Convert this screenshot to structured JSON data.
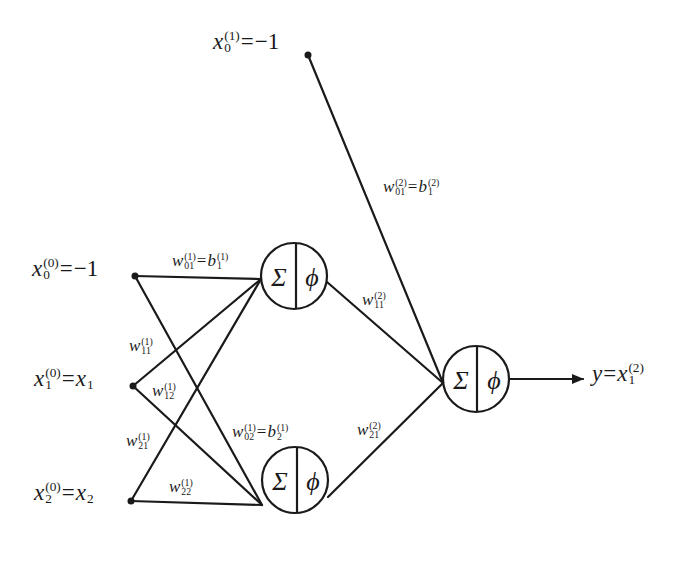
{
  "diagram": {
    "type": "neural-network",
    "colors": {
      "stroke": "#1a1a1a",
      "background": "#ffffff"
    },
    "layers": {
      "input": [
        {
          "id": "x0",
          "var": "x",
          "sub": "0",
          "sup": "(0)",
          "eq": "=",
          "rhs": "−1",
          "rhs_var": "",
          "rhs_sub": ""
        },
        {
          "id": "x1",
          "var": "x",
          "sub": "1",
          "sup": "(0)",
          "eq": "=",
          "rhs": "",
          "rhs_var": "x",
          "rhs_sub": "1"
        },
        {
          "id": "x2",
          "var": "x",
          "sub": "2",
          "sup": "(0)",
          "eq": "=",
          "rhs": "",
          "rhs_var": "x",
          "rhs_sub": "2"
        }
      ],
      "hidden_bias": {
        "id": "x0_1",
        "var": "x",
        "sub": "0",
        "sup": "(1)",
        "eq": "=",
        "rhs": "−1"
      },
      "hidden_neurons": [
        {
          "id": "h1",
          "sum_symbol": "Σ",
          "activation_symbol": "ϕ"
        },
        {
          "id": "h2",
          "sum_symbol": "Σ",
          "activation_symbol": "ϕ"
        }
      ],
      "output_neuron": {
        "id": "o1",
        "sum_symbol": "Σ",
        "activation_symbol": "ϕ"
      },
      "output": {
        "lhs": "y",
        "eq": "=",
        "var": "x",
        "sub": "1",
        "sup": "(2)"
      }
    },
    "weights": {
      "w01_1": {
        "w": "w",
        "sup": "(1)",
        "sub": "01",
        "eq": "=",
        "b": "b",
        "b_sup": "(1)",
        "b_sub": "1"
      },
      "w11_1": {
        "w": "w",
        "sup": "(1)",
        "sub": "11"
      },
      "w12_1": {
        "w": "w",
        "sup": "(1)",
        "sub": "12"
      },
      "w21_1": {
        "w": "w",
        "sup": "(1)",
        "sub": "21"
      },
      "w22_1": {
        "w": "w",
        "sup": "(1)",
        "sub": "22"
      },
      "w02_1": {
        "w": "w",
        "sup": "(1)",
        "sub": "02",
        "eq": "=",
        "b": "b",
        "b_sup": "(1)",
        "b_sub": "2"
      },
      "w01_2": {
        "w": "w",
        "sup": "(2)",
        "sub": "01",
        "eq": "=",
        "b": "b",
        "b_sup": "(2)",
        "b_sub": "1"
      },
      "w11_2": {
        "w": "w",
        "sup": "(2)",
        "sub": "11"
      },
      "w21_2": {
        "w": "w",
        "sup": "(2)",
        "sub": "21"
      }
    }
  }
}
